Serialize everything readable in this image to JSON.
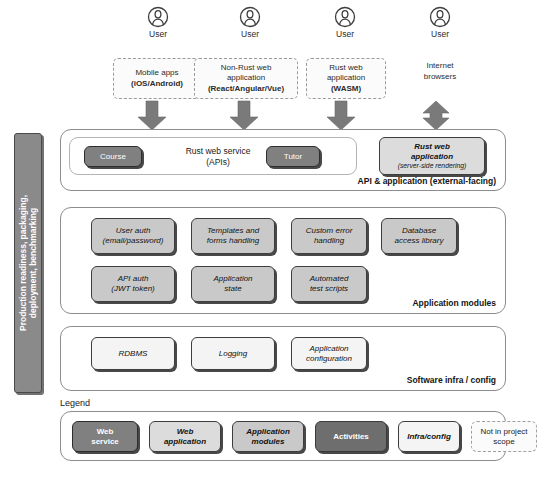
{
  "diagram": {
    "colors": {
      "web_service": "#808080",
      "web_application": "#dcdcdc",
      "application_modules": "#c9c9c9",
      "activities": "#6e6e6e",
      "infra_config": "#f4f4f4",
      "not_in_scope": "#fbfbfb",
      "arrow": "#777777",
      "sidebar": "#8a8a8a",
      "panel_border": "#8d8d8d"
    }
  },
  "clients": [
    {
      "user_label": "User",
      "icon": "user-icon",
      "boxed": true,
      "lines": [
        {
          "text": "Mobile apps",
          "bold": false
        },
        {
          "text": "(iOS/Android)",
          "bold": true
        }
      ],
      "arrow": "down"
    },
    {
      "user_label": "User",
      "icon": "user-icon",
      "boxed": true,
      "lines": [
        {
          "text": "Non-Rust web",
          "bold": false
        },
        {
          "text": "application",
          "bold": false
        },
        {
          "text": "(React/Angular/Vue)",
          "bold": true
        }
      ],
      "arrow": "down"
    },
    {
      "user_label": "User",
      "icon": "user-icon",
      "boxed": true,
      "lines": [
        {
          "text": "Rust web",
          "bold": false
        },
        {
          "text": "application",
          "bold": false
        },
        {
          "text": "(WASM)",
          "bold": true
        }
      ],
      "arrow": "down"
    },
    {
      "user_label": "User",
      "icon": "user-icon",
      "boxed": false,
      "lines": [
        {
          "text": "Internet",
          "bold": false
        },
        {
          "text": "browsers",
          "bold": false
        }
      ],
      "arrow": "both"
    }
  ],
  "sidebar": {
    "label": "Production readiness, packaging,\ndeployment, benchmarking",
    "line1": "Production readiness, packaging,",
    "line2": "deployment, benchmarking"
  },
  "layers": [
    {
      "id": "api-application",
      "label": "API & application (external-facing)",
      "service_group": {
        "title_line1": "Rust web service",
        "title_line2": "(APIs)",
        "activities": [
          {
            "label": "Course"
          },
          {
            "label": "Tutor"
          }
        ]
      },
      "webapp": {
        "line1": "Rust web",
        "line2": "application",
        "note": "(server-side rendering)"
      }
    },
    {
      "id": "application-modules",
      "label": "Application modules",
      "modules_row1": [
        {
          "line1": "User auth",
          "line2": "(email/password)"
        },
        {
          "line1": "Templates and",
          "line2": "forms handling"
        },
        {
          "line1": "Custom error",
          "line2": "handling"
        },
        {
          "line1": "Database",
          "line2": "access library"
        }
      ],
      "modules_row2": [
        {
          "line1": "API auth",
          "line2": "(JWT token)"
        },
        {
          "line1": "Application",
          "line2": "state"
        },
        {
          "line1": "Automated",
          "line2": "test scripts"
        }
      ]
    },
    {
      "id": "software-infra",
      "label": "Software infra / config",
      "items": [
        {
          "line1": "RDBMS",
          "line2": ""
        },
        {
          "line1": "Logging",
          "line2": ""
        },
        {
          "line1": "Application",
          "line2": "configuration"
        }
      ]
    }
  ],
  "legend": {
    "title": "Legend",
    "items": [
      {
        "line1": "Web",
        "line2": "service",
        "style": "web-service"
      },
      {
        "line1": "Web",
        "line2": "application",
        "style": "web-application"
      },
      {
        "line1": "Application",
        "line2": "modules",
        "style": "application-modules"
      },
      {
        "line1": "Activities",
        "line2": "",
        "style": "activities"
      },
      {
        "line1": "Infra/config",
        "line2": "",
        "style": "infra-config"
      },
      {
        "line1": "Not in project",
        "line2": "scope",
        "style": "not-in-scope"
      }
    ]
  }
}
